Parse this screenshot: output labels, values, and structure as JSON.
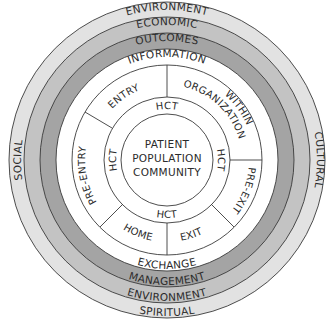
{
  "diagram": {
    "center": {
      "text_lines": [
        "PATIENT",
        "POPULATION",
        "COMMUNITY"
      ]
    },
    "hct_ring": {
      "labels": [
        "HCT",
        "HCT",
        "HCT",
        "HCT"
      ]
    },
    "segment_ring": {
      "segments": [
        {
          "id": "entry",
          "label": "ENTRY"
        },
        {
          "id": "within-organization",
          "label_lines": [
            "WITHIN",
            "ORGANIZATION"
          ]
        },
        {
          "id": "pre-exit",
          "label": "PRE-EXIT"
        },
        {
          "id": "exit",
          "label": "EXIT"
        },
        {
          "id": "home",
          "label": "HOME"
        },
        {
          "id": "pre-entry",
          "label": "PRE-ENTRY"
        }
      ]
    },
    "information_ring": {
      "top": "INFORMATION",
      "bottom": "EXCHANGE"
    },
    "outcomes_ring": {
      "top": "OUTCOMES",
      "bottom": "MANAGEMENT"
    },
    "economic_ring": {
      "top": "ECONOMIC",
      "bottom": "ENVIRONMENT"
    },
    "outer_ring": {
      "top": "ENVIRONMENT",
      "bottom": "SPIRITUAL",
      "left": "SOCIAL",
      "right": "CULTURAL"
    },
    "colors": {
      "outer_ring": "#e2e2e2",
      "economic_ring": "#c3c3c3",
      "outcomes_ring": "#a4a4a4",
      "inner_rings": "#ffffff",
      "stroke": "#3a3a3a",
      "text": "#2b2b2b"
    }
  }
}
